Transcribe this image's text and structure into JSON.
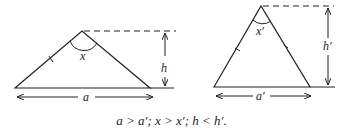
{
  "figure": {
    "left_triangle": {
      "base_label": "a",
      "angle_label": "x",
      "height_label": "h"
    },
    "right_triangle": {
      "base_label": "a′",
      "angle_label": "x′",
      "height_label": "h′"
    },
    "caption": "a > a′; x > x′; h < h′."
  }
}
